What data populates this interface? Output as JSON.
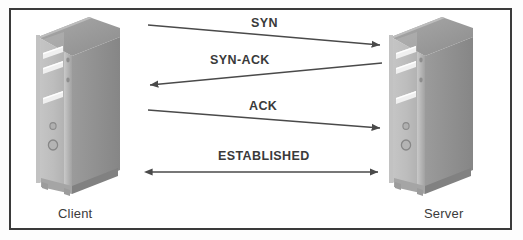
{
  "figure": {
    "type": "tcp-three-way-handshake",
    "background": "#ffffff",
    "border_color": "#3a3a3a"
  },
  "nodes": [
    {
      "id": "client",
      "label": "Client",
      "icon": "desktop-tower-icon",
      "side": "left"
    },
    {
      "id": "server",
      "label": "Server",
      "icon": "desktop-tower-icon",
      "side": "right"
    }
  ],
  "messages": [
    {
      "id": "syn",
      "label": "SYN",
      "direction": "client-to-server"
    },
    {
      "id": "syn-ack",
      "label": "SYN-ACK",
      "direction": "server-to-client"
    },
    {
      "id": "ack",
      "label": "ACK",
      "direction": "client-to-server"
    },
    {
      "id": "established",
      "label": "ESTABLISHED",
      "direction": "bidirectional"
    }
  ],
  "colors": {
    "arrow": "#4a4a4a",
    "text": "#3a3a3a",
    "tower_front": "#b9b9b9",
    "tower_side": "#8f8f8f",
    "tower_top": "#9a9a9a",
    "bay_slot": "#eeeeee"
  }
}
